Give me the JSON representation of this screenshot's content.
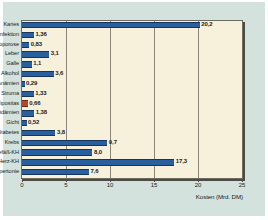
{
  "chart_data": {
    "type": "bar",
    "orientation": "horizontal",
    "title": "",
    "xlabel": "Kosten (Mrd. DM)",
    "ylabel": "",
    "xlim": [
      0,
      25
    ],
    "xticks": [
      "0",
      "5",
      "10",
      "15",
      "20",
      "25"
    ],
    "grid": true,
    "legend": "none",
    "categories": [
      "Karies",
      "Übn-Infektion",
      "Osteoporose",
      "Leber",
      "Galle",
      "Alkohol",
      "Anämien",
      "Struma",
      "Adipositas",
      "Hyperlipidämien",
      "Gicht",
      "Diabetes",
      "Krebs",
      "Gefäß-KH",
      "Herz-KH",
      "Hypertonie"
    ],
    "values": [
      20.2,
      1.36,
      0.83,
      3.1,
      1.1,
      3.6,
      0.29,
      1.33,
      0.66,
      1.38,
      0.52,
      3.8,
      9.7,
      8.0,
      17.3,
      7.6
    ],
    "value_labels": [
      "20,2",
      "1,36",
      "0,83",
      "3,1",
      "1,1",
      "3,6",
      "0,29",
      "1,33",
      "0,66",
      "1,38",
      "0,52",
      "3,8",
      "9,7",
      "8,0",
      "17,3",
      "7,6"
    ],
    "bar_colors": [
      "#2a5f9e",
      "#2a5f9e",
      "#2a5f9e",
      "#2a5f9e",
      "#2a5f9e",
      "#2a5f9e",
      "#2a5f9e",
      "#2a5f9e",
      "#b5482a",
      "#2a5f9e",
      "#2a5f9e",
      "#2a5f9e",
      "#2a5f9e",
      "#2a5f9e",
      "#2a5f9e",
      "#2a5f9e"
    ],
    "colors": {
      "bar": "#2a5f9e",
      "bar_accent": "#b5482a",
      "plot_background": "#f7f1dc",
      "panel_background": "#d3e2dc",
      "axis": "#4d4b46",
      "grid": "#8b8778",
      "text": "#1a1a1a"
    }
  }
}
